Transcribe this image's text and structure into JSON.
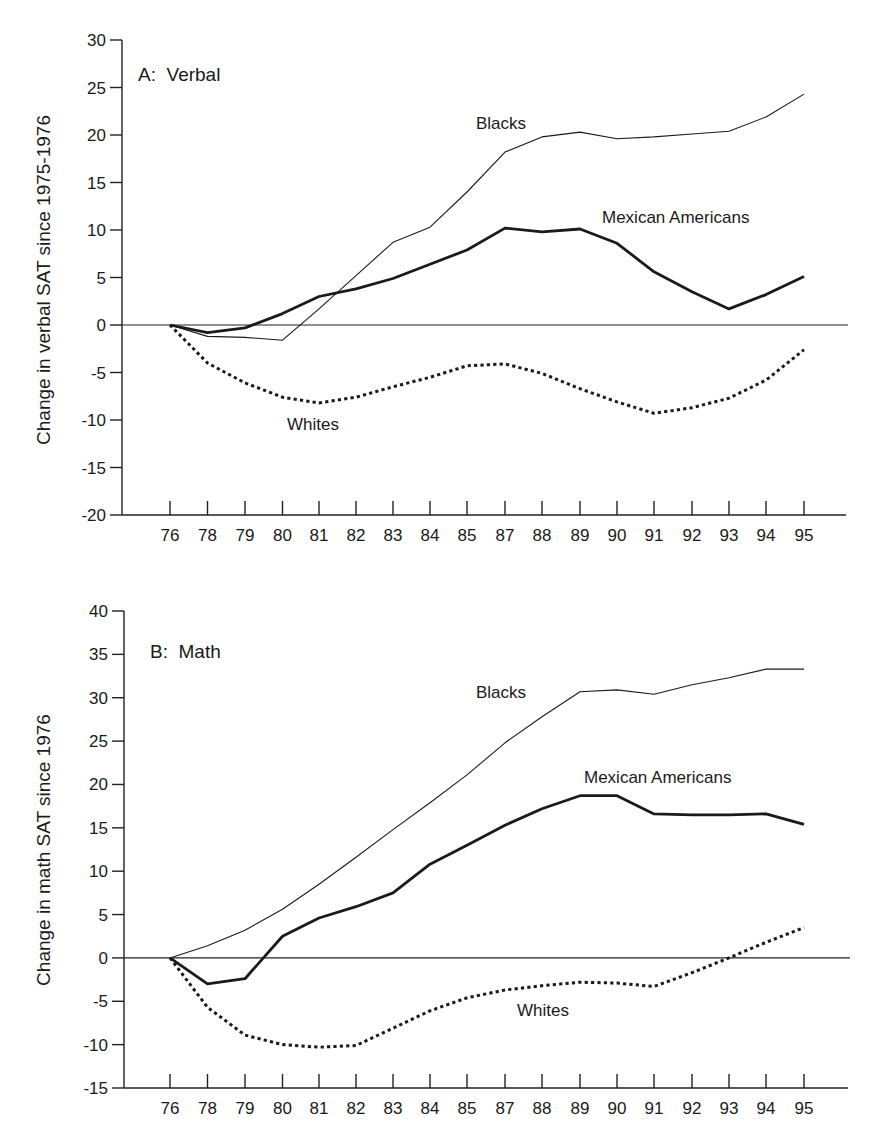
{
  "chart_data": [
    {
      "type": "line",
      "panel_title": "A:  Verbal",
      "title": "A: Verbal",
      "xlabel": "",
      "ylabel": "Change in verbal SAT since 1975-1976",
      "ylim": [
        -20,
        30
      ],
      "yticks": [
        30,
        25,
        20,
        15,
        10,
        5,
        0,
        -5,
        -10,
        -15,
        -20
      ],
      "grid": false,
      "legend": "inline labels",
      "categories": [
        "76",
        "78",
        "79",
        "80",
        "81",
        "82",
        "83",
        "84",
        "85",
        "87",
        "88",
        "89",
        "90",
        "91",
        "92",
        "93",
        "94",
        "95"
      ],
      "series": [
        {
          "name": "Blacks",
          "style": "thin-solid",
          "values": [
            0,
            -1.2,
            -1.3,
            -1.6,
            1.7,
            5.2,
            8.7,
            10.3,
            14.0,
            18.2,
            19.8,
            20.3,
            19.6,
            19.8,
            20.1,
            20.4,
            21.9,
            24.3
          ]
        },
        {
          "name": "Mexican Americans",
          "style": "thick-solid",
          "values": [
            0,
            -0.8,
            -0.3,
            1.2,
            3.0,
            3.8,
            4.9,
            6.4,
            7.9,
            10.2,
            9.8,
            10.1,
            8.6,
            5.6,
            3.5,
            1.7,
            3.2,
            5.1
          ]
        },
        {
          "name": "Whites",
          "style": "dotted",
          "values": [
            0,
            -4.0,
            -6.1,
            -7.6,
            -8.2,
            -7.6,
            -6.5,
            -5.5,
            -4.3,
            -4.1,
            -5.1,
            -6.7,
            -8.1,
            -9.3,
            -8.7,
            -7.7,
            -5.8,
            -2.6
          ]
        }
      ]
    },
    {
      "type": "line",
      "panel_title": "B:  Math",
      "title": "B: Math",
      "xlabel": "",
      "ylabel": "Change in math SAT since 1976",
      "ylim": [
        -15,
        40
      ],
      "yticks": [
        40,
        35,
        30,
        25,
        20,
        15,
        10,
        5,
        0,
        -5,
        -10,
        -15
      ],
      "grid": false,
      "legend": "inline labels",
      "categories": [
        "76",
        "78",
        "79",
        "80",
        "81",
        "82",
        "83",
        "84",
        "85",
        "87",
        "88",
        "89",
        "90",
        "91",
        "92",
        "93",
        "94",
        "95"
      ],
      "series": [
        {
          "name": "Blacks",
          "style": "thin-solid",
          "values": [
            0,
            1.4,
            3.2,
            5.6,
            8.5,
            11.6,
            14.8,
            17.9,
            21.1,
            24.8,
            27.8,
            30.7,
            30.9,
            30.4,
            31.5,
            32.3,
            33.3,
            33.3
          ]
        },
        {
          "name": "Mexican Americans",
          "style": "thick-solid",
          "values": [
            0,
            -3.0,
            -2.4,
            2.5,
            4.6,
            5.9,
            7.5,
            10.8,
            13.0,
            15.3,
            17.2,
            18.7,
            18.7,
            16.6,
            16.5,
            16.5,
            16.6,
            15.4
          ]
        },
        {
          "name": "Whites",
          "style": "dotted",
          "values": [
            0,
            -5.7,
            -8.9,
            -10.0,
            -10.3,
            -10.1,
            -8.1,
            -6.1,
            -4.6,
            -3.7,
            -3.2,
            -2.8,
            -2.9,
            -3.3,
            -1.7,
            0.0,
            1.8,
            3.5
          ]
        }
      ]
    }
  ],
  "panels": [
    {
      "title": "A:  Verbal",
      "ylabel": "Change in verbal SAT since 1975-1976",
      "labels": {
        "blacks": "Blacks",
        "mexican": "Mexican Americans",
        "whites": "Whites"
      }
    },
    {
      "title": "B:  Math",
      "ylabel": "Change in math SAT since 1976",
      "labels": {
        "blacks": "Blacks",
        "mexican": "Mexican Americans",
        "whites": "Whites"
      }
    }
  ],
  "colors": {
    "line": "#1a1a1a",
    "background": "#ffffff"
  }
}
